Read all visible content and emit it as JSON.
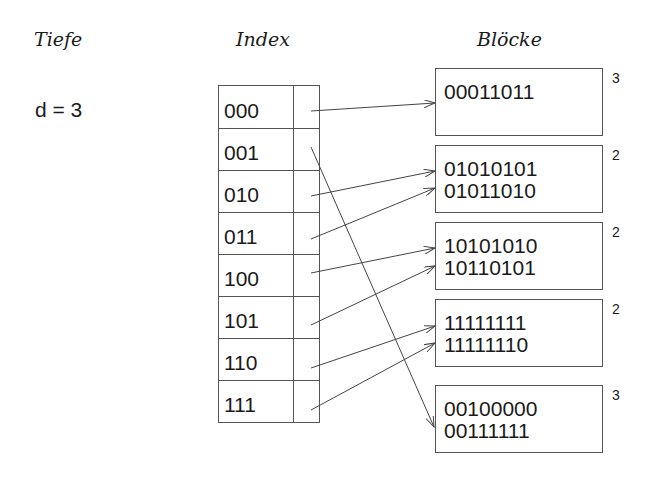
{
  "headers": {
    "depth": "Tiefe",
    "index": "Index",
    "blocks": "Blöcke"
  },
  "global_depth": "d = 3",
  "index": [
    {
      "key": "000",
      "target_block": 0
    },
    {
      "key": "001",
      "target_block": 4
    },
    {
      "key": "010",
      "target_block": 1
    },
    {
      "key": "011",
      "target_block": 1
    },
    {
      "key": "100",
      "target_block": 2
    },
    {
      "key": "101",
      "target_block": 2
    },
    {
      "key": "110",
      "target_block": 3
    },
    {
      "key": "111",
      "target_block": 3
    }
  ],
  "blocks": [
    {
      "records": [
        "00011011",
        ""
      ],
      "local_depth": "3"
    },
    {
      "records": [
        "01010101",
        "01011010"
      ],
      "local_depth": "2"
    },
    {
      "records": [
        "10101010",
        "10110101"
      ],
      "local_depth": "2"
    },
    {
      "records": [
        "11111111",
        "11111110"
      ],
      "local_depth": "2"
    },
    {
      "records": [
        "00100000",
        "00111111"
      ],
      "local_depth": "3"
    }
  ]
}
